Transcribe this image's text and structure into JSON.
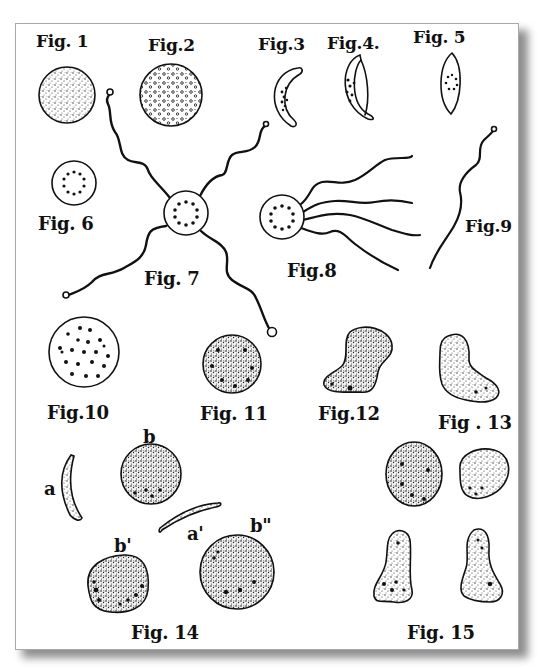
{
  "plate": {
    "background": "#ffffff",
    "ink": "#111111",
    "shadow": "#8e8e8e",
    "border": "#a9a9a9"
  },
  "labels": {
    "fig1": "Fig. 1",
    "fig2": "Fig.2",
    "fig3": "Fig.3",
    "fig4": "Fig.4.",
    "fig5": "Fig. 5",
    "fig6": "Fig. 6",
    "fig7": "Fig. 7",
    "fig8": "Fig.8",
    "fig9": "Fig.9",
    "fig10": "Fig.10",
    "fig11": "Fig. 11",
    "fig12": "Fig.12",
    "fig13": "Fig . 13",
    "fig14": "Fig. 14",
    "fig15": "Fig. 15"
  },
  "fig14_parts": {
    "a": "a",
    "a_prime": "a'",
    "b": "b",
    "b_prime": "b'",
    "b_double_prime": "b\""
  },
  "figures": [
    {
      "id": "fig1",
      "shape": "sphere-stippled",
      "cx": 67,
      "cy": 95,
      "r": 28
    },
    {
      "id": "fig2",
      "shape": "sphere-granular",
      "cx": 171,
      "cy": 95,
      "r": 31
    },
    {
      "id": "fig3",
      "shape": "crescent-dotted",
      "cx": 285,
      "cy": 98
    },
    {
      "id": "fig4",
      "shape": "crescent-double",
      "cx": 354,
      "cy": 98
    },
    {
      "id": "fig5",
      "shape": "spindle-ring",
      "cx": 450,
      "cy": 82
    },
    {
      "id": "fig6",
      "shape": "sphere-ring",
      "cx": 74,
      "cy": 183,
      "r": 22
    },
    {
      "id": "fig7",
      "shape": "sphere-ring-4-flagella",
      "cx": 186,
      "cy": 213,
      "r": 22
    },
    {
      "id": "fig8",
      "shape": "sphere-ring-4-flagella-tail",
      "cx": 282,
      "cy": 217,
      "r": 22
    },
    {
      "id": "fig9",
      "shape": "free-flagellum",
      "x1": 430,
      "y1": 268,
      "x2": 494,
      "y2": 132
    },
    {
      "id": "fig10",
      "shape": "sphere-dotted",
      "cx": 84,
      "cy": 352,
      "r": 35
    },
    {
      "id": "fig11",
      "shape": "sphere-stippled-dotted",
      "cx": 232,
      "cy": 364,
      "r": 29
    },
    {
      "id": "fig12",
      "shape": "amoeboid",
      "cx": 355,
      "cy": 363
    },
    {
      "id": "fig13",
      "shape": "amoeboid",
      "cx": 472,
      "cy": 371
    },
    {
      "id": "fig14a",
      "shape": "sickle",
      "cx": 68,
      "cy": 490
    },
    {
      "id": "fig14a2",
      "shape": "sickle",
      "cx": 189,
      "cy": 512
    },
    {
      "id": "fig14b",
      "shape": "sphere-stippled-dotted",
      "cx": 151,
      "cy": 474,
      "r": 30
    },
    {
      "id": "fig14b2",
      "shape": "sphere-stippled-dotted",
      "cx": 118,
      "cy": 585,
      "r": 32
    },
    {
      "id": "fig14b3",
      "shape": "sphere-stippled-dotted",
      "cx": 237,
      "cy": 572,
      "r": 37
    },
    {
      "id": "fig15a",
      "shape": "sphere-stippled-dotted",
      "cx": 414,
      "cy": 474,
      "r": 30
    },
    {
      "id": "fig15b",
      "shape": "oval-stippled",
      "cx": 482,
      "cy": 474
    },
    {
      "id": "fig15c",
      "shape": "amoeboid",
      "cx": 399,
      "cy": 565
    },
    {
      "id": "fig15d",
      "shape": "amoeboid",
      "cx": 483,
      "cy": 565
    }
  ]
}
